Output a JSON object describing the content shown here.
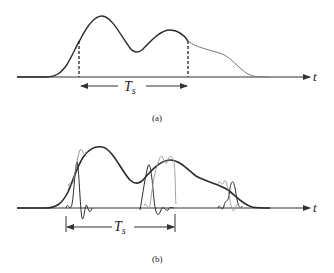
{
  "figure": {
    "panel_a": {
      "caption": "(a)",
      "axis_label": "t",
      "interval_label": "T",
      "interval_subscript": "s",
      "description": "Pulse waveform with sampling interval Ts marked by dashed lines"
    },
    "panel_b": {
      "caption": "(b)",
      "axis_label": "t",
      "interval_label": "T",
      "interval_subscript": "s",
      "description": "Waveform reconstructed from interpolating sinc-like pulses spaced Ts apart"
    },
    "colors": {
      "curve": "#2a2a2a",
      "secondary_curve": "#8a8a8a",
      "axis": "#333333"
    }
  }
}
